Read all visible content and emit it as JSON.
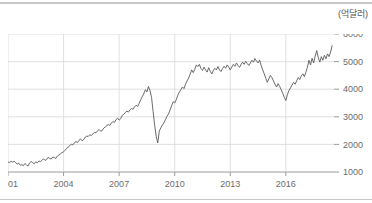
{
  "unit": {
    "label": "(억달러)"
  },
  "chart_data": {
    "type": "line",
    "title": "",
    "subtitle": "",
    "xlabel": "",
    "ylabel": "",
    "unit_note": "(억달러)",
    "grid": true,
    "legend": null,
    "legend_position": "none",
    "xlim": [
      2001.0,
      2018.6
    ],
    "ylim": [
      1000,
      6000
    ],
    "x_tick_labels": [
      "2001",
      "2004",
      "2007",
      "2010",
      "2013",
      "2016"
    ],
    "x_tick_values": [
      2001,
      2004,
      2007,
      2010,
      2013,
      2016
    ],
    "y_tick_labels": [
      "1000",
      "2000",
      "3000",
      "4000",
      "5000",
      "6000"
    ],
    "y_tick_values": [
      1000,
      2000,
      3000,
      4000,
      5000,
      6000
    ],
    "series": [
      {
        "name": "수출액",
        "color": "#595959",
        "x": [
          2001.0,
          2001.083,
          2001.167,
          2001.25,
          2001.333,
          2001.417,
          2001.5,
          2001.583,
          2001.667,
          2001.75,
          2001.833,
          2001.917,
          2002.0,
          2002.083,
          2002.167,
          2002.25,
          2002.333,
          2002.417,
          2002.5,
          2002.583,
          2002.667,
          2002.75,
          2002.833,
          2002.917,
          2003.0,
          2003.083,
          2003.167,
          2003.25,
          2003.333,
          2003.417,
          2003.5,
          2003.583,
          2003.667,
          2003.75,
          2003.833,
          2003.917,
          2004.0,
          2004.083,
          2004.167,
          2004.25,
          2004.333,
          2004.417,
          2004.5,
          2004.583,
          2004.667,
          2004.75,
          2004.833,
          2004.917,
          2005.0,
          2005.083,
          2005.167,
          2005.25,
          2005.333,
          2005.417,
          2005.5,
          2005.583,
          2005.667,
          2005.75,
          2005.833,
          2005.917,
          2006.0,
          2006.083,
          2006.167,
          2006.25,
          2006.333,
          2006.417,
          2006.5,
          2006.583,
          2006.667,
          2006.75,
          2006.833,
          2006.917,
          2007.0,
          2007.083,
          2007.167,
          2007.25,
          2007.333,
          2007.417,
          2007.5,
          2007.583,
          2007.667,
          2007.75,
          2007.833,
          2007.917,
          2008.0,
          2008.083,
          2008.167,
          2008.25,
          2008.333,
          2008.417,
          2008.5,
          2008.583,
          2008.667,
          2008.75,
          2008.833,
          2008.917,
          2009.0,
          2009.083,
          2009.167,
          2009.25,
          2009.333,
          2009.417,
          2009.5,
          2009.583,
          2009.667,
          2009.75,
          2009.833,
          2009.917,
          2010.0,
          2010.083,
          2010.167,
          2010.25,
          2010.333,
          2010.417,
          2010.5,
          2010.583,
          2010.667,
          2010.75,
          2010.833,
          2010.917,
          2011.0,
          2011.083,
          2011.167,
          2011.25,
          2011.333,
          2011.417,
          2011.5,
          2011.583,
          2011.667,
          2011.75,
          2011.833,
          2011.917,
          2012.0,
          2012.083,
          2012.167,
          2012.25,
          2012.333,
          2012.417,
          2012.5,
          2012.583,
          2012.667,
          2012.75,
          2012.833,
          2012.917,
          2013.0,
          2013.083,
          2013.167,
          2013.25,
          2013.333,
          2013.417,
          2013.5,
          2013.583,
          2013.667,
          2013.75,
          2013.833,
          2013.917,
          2014.0,
          2014.083,
          2014.167,
          2014.25,
          2014.333,
          2014.417,
          2014.5,
          2014.583,
          2014.667,
          2014.75,
          2014.833,
          2014.917,
          2015.0,
          2015.083,
          2015.167,
          2015.25,
          2015.333,
          2015.417,
          2015.5,
          2015.583,
          2015.667,
          2015.75,
          2015.833,
          2015.917,
          2016.0,
          2016.083,
          2016.167,
          2016.25,
          2016.333,
          2016.417,
          2016.5,
          2016.583,
          2016.667,
          2016.75,
          2016.833,
          2016.917,
          2017.0,
          2017.083,
          2017.167,
          2017.25,
          2017.333,
          2017.417,
          2017.5,
          2017.583,
          2017.667,
          2017.75,
          2017.833,
          2017.917,
          2018.0,
          2018.083,
          2018.167,
          2018.25,
          2018.333,
          2018.417,
          2018.5
        ],
        "values": [
          1370,
          1330,
          1395,
          1355,
          1390,
          1330,
          1290,
          1320,
          1245,
          1265,
          1230,
          1310,
          1255,
          1215,
          1330,
          1380,
          1340,
          1300,
          1370,
          1330,
          1400,
          1380,
          1420,
          1480,
          1420,
          1450,
          1530,
          1490,
          1470,
          1545,
          1520,
          1495,
          1580,
          1615,
          1660,
          1700,
          1730,
          1790,
          1860,
          1900,
          1950,
          2010,
          1980,
          2060,
          2100,
          2070,
          2150,
          2200,
          2130,
          2170,
          2260,
          2300,
          2290,
          2350,
          2320,
          2380,
          2440,
          2420,
          2490,
          2540,
          2480,
          2500,
          2590,
          2630,
          2680,
          2720,
          2690,
          2770,
          2830,
          2800,
          2900,
          2950,
          2880,
          2930,
          3050,
          3090,
          3150,
          3210,
          3170,
          3250,
          3300,
          3270,
          3360,
          3420,
          3370,
          3490,
          3620,
          3730,
          3840,
          3980,
          3900,
          4100,
          3950,
          3700,
          3200,
          2700,
          2300,
          2050,
          2480,
          2600,
          2700,
          2780,
          2900,
          3020,
          3100,
          3250,
          3400,
          3550,
          3500,
          3620,
          3780,
          3900,
          3980,
          4080,
          4020,
          4180,
          4300,
          4400,
          4550,
          4700,
          4600,
          4720,
          4880,
          4820,
          4900,
          4750,
          4680,
          4800,
          4700,
          4620,
          4780,
          4650,
          4550,
          4680,
          4760,
          4700,
          4820,
          4700,
          4640,
          4750,
          4830,
          4760,
          4880,
          4800,
          4700,
          4800,
          4900,
          4830,
          4950,
          4860,
          4790,
          4900,
          4980,
          4900,
          5010,
          4930,
          4860,
          4950,
          5050,
          4980,
          5110,
          5020,
          4950,
          5060,
          4860,
          4700,
          4560,
          4400,
          4250,
          4380,
          4500,
          4420,
          4300,
          4180,
          4080,
          4200,
          4100,
          3980,
          3850,
          3700,
          3590,
          3800,
          3950,
          4050,
          4150,
          4250,
          4180,
          4300,
          4420,
          4350,
          4480,
          4560,
          4450,
          4620,
          4800,
          5050,
          4880,
          5120,
          4950,
          5200,
          5400,
          5150,
          4980,
          5180,
          5050,
          5230,
          5100,
          5280,
          5180,
          5350,
          5580
        ]
      }
    ]
  }
}
